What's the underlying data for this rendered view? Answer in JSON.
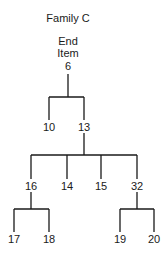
{
  "title": "Family C",
  "root": {
    "label_line1": "End",
    "label_line2": "Item",
    "id": "6"
  },
  "tree": {
    "id": "6",
    "children": [
      {
        "id": "10",
        "children": []
      },
      {
        "id": "13",
        "children": [
          {
            "id": "16",
            "children": [
              {
                "id": "17"
              },
              {
                "id": "18"
              }
            ]
          },
          {
            "id": "14",
            "children": []
          },
          {
            "id": "15",
            "children": []
          },
          {
            "id": "32",
            "children": [
              {
                "id": "19"
              },
              {
                "id": "20"
              }
            ]
          }
        ]
      }
    ]
  },
  "nodes": {
    "n6": "6",
    "n10": "10",
    "n13": "13",
    "n16": "16",
    "n14": "14",
    "n15": "15",
    "n32": "32",
    "n17": "17",
    "n18": "18",
    "n19": "19",
    "n20": "20"
  }
}
